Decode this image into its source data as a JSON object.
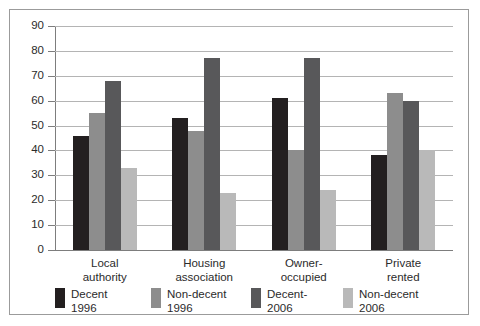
{
  "chart_data": {
    "type": "bar",
    "title": "",
    "subtitle": "",
    "xlabel": "",
    "ylabel": "",
    "ylim": [
      0,
      90
    ],
    "ytick_step": 10,
    "yticks": [
      "90",
      "80",
      "70",
      "60",
      "50",
      "40",
      "30",
      "20",
      "10",
      "0"
    ],
    "grid": true,
    "legend_position": "bottom",
    "categories": [
      {
        "line1": "Local",
        "line2": "authority"
      },
      {
        "line1": "Housing",
        "line2": "association"
      },
      {
        "line1": "Owner-",
        "line2": "occupied"
      },
      {
        "line1": "Private",
        "line2": "rented"
      }
    ],
    "category_labels": [
      "Local authority",
      "Housing association",
      "Owner-occupied",
      "Private rented"
    ],
    "series": [
      {
        "name": "Decent 1996",
        "legend_line1": "Decent",
        "legend_line2": "1996",
        "color": "#231f20",
        "values": [
          46,
          53,
          61,
          38
        ]
      },
      {
        "name": "Non-decent 1996",
        "legend_line1": "Non-decent",
        "legend_line2": "1996",
        "color": "#8d8d8d",
        "values": [
          55,
          48,
          40,
          63
        ]
      },
      {
        "name": "Decent-2006",
        "legend_line1": "Decent-",
        "legend_line2": "2006",
        "color": "#58585a",
        "values": [
          68,
          77,
          77,
          60
        ]
      },
      {
        "name": "Non-decent 2006",
        "legend_line1": "Non-decent",
        "legend_line2": "2006",
        "color": "#b9b9b9",
        "values": [
          33,
          23,
          24,
          40
        ]
      }
    ]
  },
  "style": {
    "frame_border_color": "#9b9b9b",
    "gridline_color": "#b4b4b4",
    "axis_color": "#7d7d7d",
    "text_color": "#2b2b2b",
    "background": "#ffffff"
  }
}
